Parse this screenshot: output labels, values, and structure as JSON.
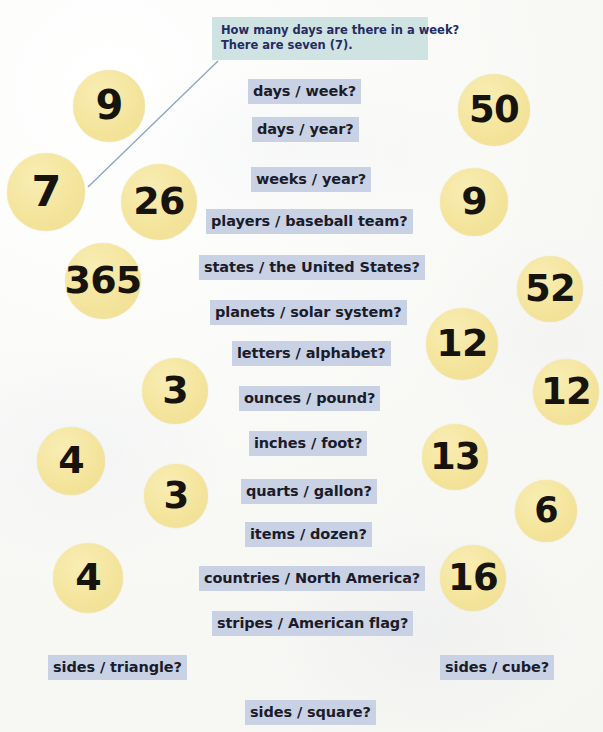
{
  "page": {
    "background_color": "#fbfbf8",
    "bubble_color": "#f4e49b",
    "label_highlight_color": "#c9d2e5",
    "callout_color": "#cfe3e2",
    "label_text_color": "#1b1b2a",
    "callout_text_color": "#262b63",
    "leader_line_color": "#8fa6c4"
  },
  "callout": {
    "name": "example-callout",
    "line1": "How many days are there in a week?",
    "line2": "There are seven (7)."
  },
  "labels": [
    {
      "text": "days / week?",
      "x": 248,
      "y": 79,
      "w": 132
    },
    {
      "text": "days / year?",
      "x": 252,
      "y": 117,
      "w": 124
    },
    {
      "text": "weeks / year?",
      "x": 251,
      "y": 167,
      "w": 141
    },
    {
      "text": "players / baseball team?",
      "x": 206,
      "y": 209,
      "w": 228
    },
    {
      "text": "states / the United States?",
      "x": 199,
      "y": 255,
      "w": 241
    },
    {
      "text": "planets / solar system?",
      "x": 210,
      "y": 300,
      "w": 220
    },
    {
      "text": "letters / alphabet?",
      "x": 232,
      "y": 341,
      "w": 176
    },
    {
      "text": "ounces / pound?",
      "x": 239,
      "y": 386,
      "w": 163
    },
    {
      "text": "inches / foot?",
      "x": 249,
      "y": 431,
      "w": 137
    },
    {
      "text": "quarts / gallon?",
      "x": 241,
      "y": 479,
      "w": 156
    },
    {
      "text": "items / dozen?",
      "x": 245,
      "y": 522,
      "w": 147
    },
    {
      "text": "countries / North America?",
      "x": 199,
      "y": 566,
      "w": 239
    },
    {
      "text": "stripes / American flag?",
      "x": 212,
      "y": 611,
      "w": 212
    },
    {
      "text": "sides / triangle?",
      "x": 48,
      "y": 655,
      "w": 136
    },
    {
      "text": "sides / cube?",
      "x": 440,
      "y": 655,
      "w": 126
    },
    {
      "text": "sides / square?",
      "x": 245,
      "y": 700,
      "w": 145
    }
  ],
  "bubbles": [
    {
      "value": "9",
      "cx": 109,
      "cy": 106,
      "r": 36,
      "font": 40
    },
    {
      "value": "50",
      "cx": 494,
      "cy": 110,
      "r": 36,
      "font": 37
    },
    {
      "value": "7",
      "cx": 46,
      "cy": 192,
      "r": 39,
      "font": 43
    },
    {
      "value": "26",
      "cx": 159,
      "cy": 202,
      "r": 38,
      "font": 38
    },
    {
      "value": "9",
      "cx": 474,
      "cy": 202,
      "r": 34,
      "font": 38
    },
    {
      "value": "365",
      "cx": 103,
      "cy": 281,
      "r": 38,
      "font": 38
    },
    {
      "value": "52",
      "cx": 550,
      "cy": 289,
      "r": 33,
      "font": 37
    },
    {
      "value": "12",
      "cx": 462,
      "cy": 344,
      "r": 36,
      "font": 38
    },
    {
      "value": "3",
      "cx": 175,
      "cy": 391,
      "r": 33,
      "font": 38
    },
    {
      "value": "12",
      "cx": 566,
      "cy": 392,
      "r": 33,
      "font": 37
    },
    {
      "value": "4",
      "cx": 71,
      "cy": 461,
      "r": 34,
      "font": 38
    },
    {
      "value": "13",
      "cx": 455,
      "cy": 457,
      "r": 33,
      "font": 37
    },
    {
      "value": "3",
      "cx": 176,
      "cy": 496,
      "r": 32,
      "font": 37
    },
    {
      "value": "6",
      "cx": 546,
      "cy": 511,
      "r": 31,
      "font": 35
    },
    {
      "value": "4",
      "cx": 88,
      "cy": 578,
      "r": 35,
      "font": 38
    },
    {
      "value": "16",
      "cx": 473,
      "cy": 578,
      "r": 33,
      "font": 37
    }
  ]
}
